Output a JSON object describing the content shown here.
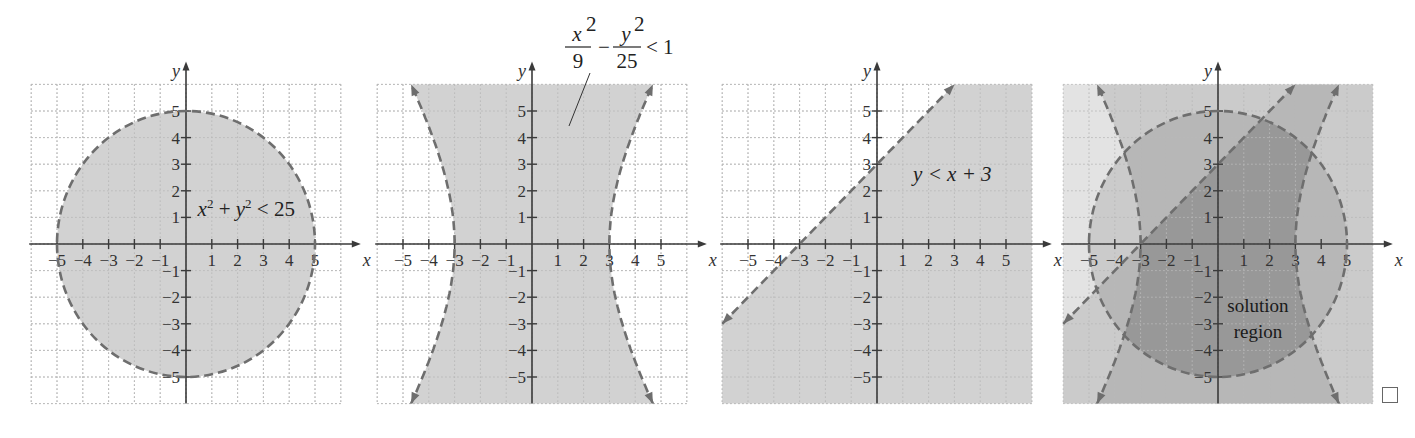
{
  "figure": {
    "panel_count": 4,
    "checkbox": {
      "icon": "empty-square-icon",
      "checked": false
    }
  },
  "style": {
    "grid_color": "#b8b8b8",
    "axis_color": "#3a3a3a",
    "boundary_color": "#6e6e6e",
    "shade_light": "#e3e3e3",
    "shade_single": "#d2d2d2",
    "shade_double": "#bfbfbf",
    "shade_triple": "#a8a8a8"
  },
  "chart_data": [
    {
      "type": "region",
      "title": "x^2 + y^2 < 25",
      "label": {
        "parts": [
          "x",
          "2",
          " + ",
          "y",
          "2",
          " < 25"
        ]
      },
      "xlabel": "x",
      "ylabel": "y",
      "xlim": [
        -6,
        6
      ],
      "ylim": [
        -6,
        6
      ],
      "x_ticks": [
        -5,
        -4,
        -3,
        -2,
        -1,
        1,
        2,
        3,
        4,
        5
      ],
      "y_ticks": [
        -5,
        -4,
        -3,
        -2,
        -1,
        1,
        2,
        3,
        4,
        5
      ],
      "x_tick_labels": [
        "−5",
        "−4",
        "−3",
        "−2",
        "−1",
        "1",
        "2",
        "3",
        "4",
        "5"
      ],
      "y_tick_labels": [
        "−5",
        "−4",
        "−3",
        "−2",
        "−1",
        "1",
        "2",
        "3",
        "4",
        "5"
      ],
      "grid": true,
      "boundary": {
        "kind": "circle",
        "center": [
          0,
          0
        ],
        "radius": 5,
        "style": "dashed"
      },
      "shaded": "inside circle"
    },
    {
      "type": "region",
      "title": "x^2/9 − y^2/25 < 1",
      "label": {
        "num1": "x",
        "sup1": "2",
        "den1": "9",
        "op": "−",
        "num2": "y",
        "sup2": "2",
        "den2": "25",
        "rel": "< 1"
      },
      "xlabel": "x",
      "ylabel": "y",
      "xlim": [
        -6,
        6
      ],
      "ylim": [
        -6,
        6
      ],
      "x_ticks": [
        -5,
        -4,
        -3,
        -2,
        -1,
        1,
        2,
        3,
        4,
        5
      ],
      "y_ticks": [
        -5,
        -4,
        -3,
        -2,
        -1,
        1,
        2,
        3,
        4,
        5
      ],
      "x_tick_labels": [
        "−5",
        "−4",
        "−3",
        "−2",
        "−1",
        "1",
        "2",
        "3",
        "4",
        "5"
      ],
      "y_tick_labels": [
        "−5",
        "−4",
        "−3",
        "−2",
        "−1",
        "1",
        "2",
        "3",
        "4",
        "5"
      ],
      "grid": true,
      "boundary": {
        "kind": "hyperbola",
        "a": 3,
        "b": 5,
        "opening": "horizontal",
        "style": "dashed",
        "arrows": true
      },
      "shaded": "between branches"
    },
    {
      "type": "region",
      "title": "y < x + 3",
      "label": {
        "text": "y < x + 3"
      },
      "xlabel": "x",
      "ylabel": "y",
      "xlim": [
        -6,
        6
      ],
      "ylim": [
        -6,
        6
      ],
      "x_ticks": [
        -5,
        -4,
        -3,
        -2,
        -1,
        1,
        2,
        3,
        4,
        5
      ],
      "y_ticks": [
        -5,
        -4,
        -3,
        -2,
        -1,
        1,
        2,
        3,
        4,
        5
      ],
      "x_tick_labels": [
        "−5",
        "−4",
        "−3",
        "−2",
        "−1",
        "1",
        "2",
        "3",
        "4",
        "5"
      ],
      "y_tick_labels": [
        "−5",
        "−4",
        "−3",
        "−2",
        "−1",
        "1",
        "2",
        "3",
        "4",
        "5"
      ],
      "grid": true,
      "boundary": {
        "kind": "line",
        "slope": 1,
        "intercept": 3,
        "from": [
          -6,
          -3
        ],
        "to": [
          3,
          6
        ],
        "style": "dashed",
        "arrows": true
      },
      "shaded": "below line"
    },
    {
      "type": "region",
      "title": "solution region",
      "label": {
        "line1": "solution",
        "line2": "region"
      },
      "xlabel": "x",
      "ylabel": "y",
      "xlim": [
        -6,
        6
      ],
      "ylim": [
        -6,
        6
      ],
      "x_ticks": [
        -5,
        -4,
        -3,
        -2,
        -1,
        1,
        2,
        3,
        4,
        5
      ],
      "y_ticks": [
        -5,
        -4,
        -3,
        -2,
        -1,
        1,
        2,
        3,
        4,
        5
      ],
      "x_tick_labels": [
        "−5",
        "−4",
        "−3",
        "−2",
        "−1",
        "1",
        "2",
        "3",
        "4",
        "5"
      ],
      "y_tick_labels": [
        "−5",
        "−4",
        "−3",
        "−2",
        "−1",
        "1",
        "2",
        "3",
        "4",
        "5"
      ],
      "grid": true,
      "boundaries": [
        "circle r=5",
        "hyperbola x^2/9 − y^2/25 = 1",
        "line y = x + 3"
      ],
      "shaded": "intersection of all three inequalities (darkest)"
    }
  ]
}
